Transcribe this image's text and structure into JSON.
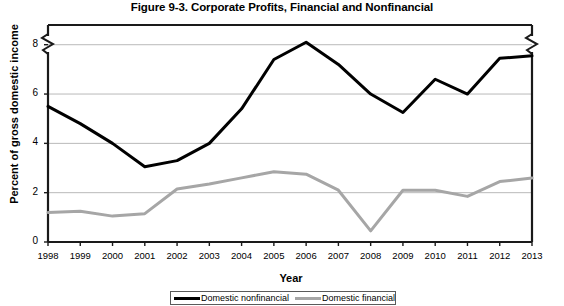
{
  "chart_data": {
    "type": "line",
    "title": "Figure 9-3. Corporate Profits, Financial and Nonfinancial",
    "xlabel": "Year",
    "ylabel": "Percent of gross domestic income",
    "categories": [
      "1998",
      "1999",
      "2000",
      "2001",
      "2002",
      "2003",
      "2004",
      "2005",
      "2006",
      "2007",
      "2008",
      "2009",
      "2010",
      "2011",
      "2012",
      "2013"
    ],
    "x": [
      1998,
      1999,
      2000,
      2001,
      2002,
      2003,
      2004,
      2005,
      2006,
      2007,
      2008,
      2009,
      2010,
      2011,
      2012,
      2013
    ],
    "ylim": [
      0,
      8.8
    ],
    "xlim": [
      1998,
      2013
    ],
    "yticks": [
      0,
      2,
      4,
      6,
      8
    ],
    "ytick_labels": [
      "0",
      "2",
      "4",
      "6",
      "8"
    ],
    "grid": "horizontal",
    "axis_break": "y-axis broken above 8",
    "legend_position": "bottom-center",
    "series": [
      {
        "name": "Domestic nonfinancial",
        "color": "#000000",
        "linewidth": 3,
        "values": [
          5.5,
          4.8,
          4.0,
          3.05,
          3.3,
          4.0,
          5.4,
          7.4,
          8.1,
          7.2,
          6.0,
          5.25,
          6.6,
          6.0,
          7.45,
          7.55
        ]
      },
      {
        "name": "Domestic financial",
        "color": "#a6a6a6",
        "linewidth": 3,
        "values": [
          1.2,
          1.25,
          1.05,
          1.15,
          2.15,
          2.35,
          2.6,
          2.85,
          2.75,
          2.1,
          0.45,
          2.1,
          2.1,
          1.85,
          2.45,
          2.6
        ]
      }
    ]
  },
  "legend": {
    "entries": [
      {
        "label": "Domestic nonfinancial",
        "color": "#000000"
      },
      {
        "label": "Domestic financial",
        "color": "#a6a6a6"
      }
    ]
  }
}
